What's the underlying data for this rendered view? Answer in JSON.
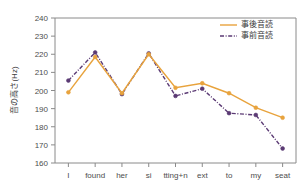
{
  "chart_data": {
    "type": "line",
    "title": "",
    "subtitle": "",
    "xlabel": "",
    "ylabel": "音の高さ(Hz)",
    "ylim": [
      160,
      240
    ],
    "yticks": [
      160,
      170,
      180,
      190,
      200,
      210,
      220,
      230,
      240
    ],
    "ytick_labels": [
      "160",
      "170",
      "180",
      "190",
      "200",
      "210",
      "220",
      "230",
      "240"
    ],
    "categories": [
      "I",
      "found",
      "her",
      "si",
      "tting+n",
      "ext",
      "to",
      "my",
      "seat"
    ],
    "grid": false,
    "legend_position": "top-right",
    "series": [
      {
        "name": "事後音読",
        "color": "#e8a33d",
        "style": "solid",
        "marker": "circle",
        "values": [
          199.0,
          218.5,
          198.5,
          220.0,
          201.5,
          204.0,
          198.5,
          190.5,
          185.0
        ]
      },
      {
        "name": "事前音読",
        "color": "#5b3a74",
        "style": "dashdot",
        "marker": "circle",
        "values": [
          205.5,
          221.0,
          198.0,
          220.5,
          197.0,
          201.0,
          187.5,
          186.5,
          168.0
        ]
      }
    ]
  },
  "legend": {
    "entries": [
      {
        "label": "事後音読"
      },
      {
        "label": "事前音読"
      }
    ]
  },
  "colors": {
    "series_post": "#e8a33d",
    "series_pre": "#5b3a74",
    "axis": "#8a8a8a",
    "text": "#4d4d4d",
    "background": "#ffffff"
  }
}
